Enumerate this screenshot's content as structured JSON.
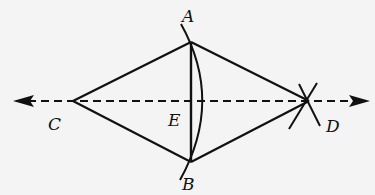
{
  "diagram": {
    "type": "geometric-construction",
    "stroke_color": "#111111",
    "background": "#f4f4f4",
    "points": {
      "A": {
        "label": "A",
        "x": 191,
        "y": 42
      },
      "B": {
        "label": "B",
        "x": 191,
        "y": 162
      },
      "C": {
        "label": "C",
        "x": 73,
        "y": 101
      },
      "D": {
        "label": "D",
        "x": 309,
        "y": 101
      },
      "E": {
        "label": "E",
        "x": 191,
        "y": 101
      }
    },
    "labels": {
      "A": "A",
      "B": "B",
      "C": "C",
      "D": "D",
      "E": "E"
    },
    "segments": [
      "CA",
      "AD",
      "CB",
      "BD",
      "AB"
    ],
    "dashed_line": {
      "from": "C",
      "to": "D",
      "extended_both_ways": true,
      "arrows": "both"
    },
    "arcs": [
      "arc through A and B bulging toward D",
      "intersecting arcs at D"
    ]
  }
}
